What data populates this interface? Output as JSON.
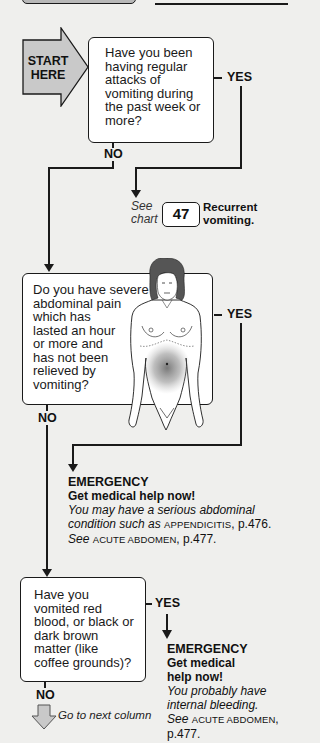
{
  "top_fragment": {
    "box_fill": "#b8b8b8",
    "line_color": "#1a1a1a"
  },
  "start_arrow": {
    "line1": "START",
    "line2": "HERE",
    "fill": "#c9c9c9"
  },
  "question_1": {
    "lines": [
      "Have you been",
      "having regular",
      "attacks of",
      "vomiting during",
      "the past week or",
      "more?"
    ],
    "yes_label": "YES",
    "no_label": "NO"
  },
  "referral_1": {
    "see": "See",
    "chart": "chart",
    "chart_number": "47",
    "title_line1": "Recurrent",
    "title_line2": "vomiting."
  },
  "question_2": {
    "lines": [
      "Do you have severe",
      "abdominal pain",
      "which has",
      "lasted an hour",
      "or more and",
      "has not been",
      "relieved by",
      "vomiting?"
    ],
    "yes_label": "YES",
    "no_label": "NO",
    "illustration": "female-torso-abdominal-pain"
  },
  "emergency_1": {
    "title": "EMERGENCY",
    "subtitle": "Get medical help now!",
    "body_italic_1": "You may have a serious abdominal",
    "body_italic_2": "condition such as",
    "condition_1": "APPENDICITIS",
    "page_1": ", p.476.",
    "see": "See",
    "condition_2": "ACUTE ABDOMEN",
    "page_2": ", p.477."
  },
  "question_3": {
    "lines": [
      "Have you",
      "vomited red",
      "blood, or black or",
      "dark brown",
      "matter (like",
      "coffee grounds)?"
    ],
    "yes_label": "YES",
    "no_label": "NO"
  },
  "emergency_2": {
    "title": "EMERGENCY",
    "subtitle_1": "Get medical",
    "subtitle_2": "help now!",
    "body_1": "You probably have",
    "body_2": "internal bleeding.",
    "see": "See",
    "condition": "ACUTE ABDOMEN",
    "comma": ",",
    "page": "p.477."
  },
  "next_column": {
    "label": "Go to next column",
    "arrow_fill": "#c9c9c9"
  }
}
